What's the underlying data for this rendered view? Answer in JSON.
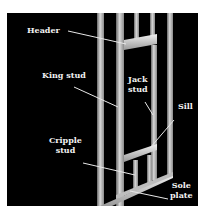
{
  "diagram": {
    "background": "#000000",
    "frame_color": "#c8c8c8",
    "labels": {
      "header": "Header",
      "king_stud": "King stud",
      "jack_stud": "Jack\nstud",
      "sill": "Sill",
      "cripple_stud": "Cripple\nstud",
      "sole_plate": "Sole\nplate"
    }
  }
}
